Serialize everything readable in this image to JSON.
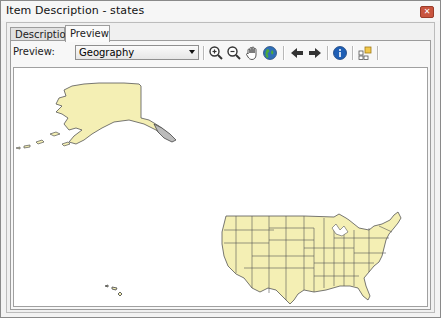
{
  "window": {
    "title": "Item Description - states",
    "close_icon": "close-icon"
  },
  "tabs": [
    {
      "label": "Description",
      "active": false
    },
    {
      "label": "Preview",
      "active": true
    }
  ],
  "toolbar": {
    "preview_label": "Preview:",
    "preview_select": {
      "value": "Geography"
    },
    "buttons": [
      {
        "name": "zoom-in",
        "icon": "zoom-in-icon"
      },
      {
        "name": "zoom-out",
        "icon": "zoom-out-icon"
      },
      {
        "name": "pan",
        "icon": "pan-hand-icon"
      },
      {
        "name": "full-extent",
        "icon": "globe-icon"
      },
      {
        "name": "back-extent",
        "icon": "arrow-left-icon"
      },
      {
        "name": "forward-extent",
        "icon": "arrow-right-icon"
      },
      {
        "name": "identify",
        "icon": "info-icon"
      },
      {
        "name": "create-thumbnail",
        "icon": "thumbnail-icon"
      }
    ]
  },
  "map": {
    "layer": "states",
    "fill_color": "#f4efb4",
    "stroke_color": "#555555"
  }
}
